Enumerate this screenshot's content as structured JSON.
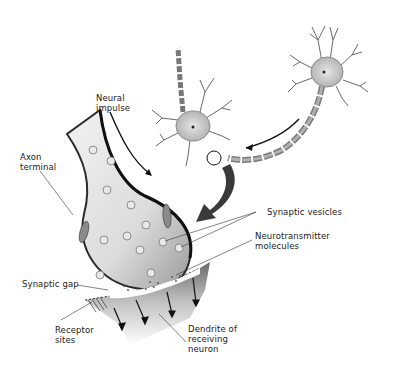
{
  "diagram": {
    "type": "labeled illustration",
    "colors": {
      "ink": "#222222",
      "tissue": "#d8d8d8",
      "tissue_dark": "#5a5a5a",
      "background": "#ffffff"
    }
  },
  "labels": {
    "neural_impulse": "Neural\nimpulse",
    "axon_terminal": "Axon\nterminal",
    "synaptic_vesicles": "Synaptic vesicles",
    "neurotransmitter_molecules": "Neurotransmitter\nmolecules",
    "synaptic_gap": "Synaptic gap",
    "receptor_sites": "Receptor\nsites",
    "dendrite_of_receiving_neuron": "Dendrite of\nreceiving\nneuron"
  },
  "elements": {
    "sending_neuron": "neuron at upper right with myelinated axon",
    "receiving_neuron": "neuron at upper middle",
    "zoom_circle": "circle marking the synapse location",
    "zoom_arrow": "large curved arrow pointing to enlarged synapse",
    "impulse_arrow": "arrow along axon showing impulse direction"
  }
}
